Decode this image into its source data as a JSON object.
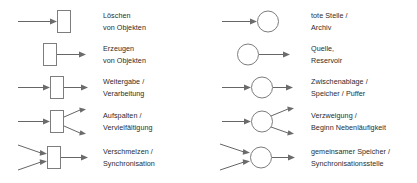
{
  "diagram": {
    "background_color": "#ffffff",
    "line_color": "#666666",
    "text_color": "#2b2b2b",
    "columns": [
      {
        "id": "transitions",
        "node_shape": "rectangle",
        "rows": [
          {
            "glyph": "arrow-in-rectangle",
            "arrows_in": 1,
            "arrows_out": 0,
            "line1": "Löschen",
            "line2": "von Objekten"
          },
          {
            "glyph": "rectangle-arrow-out",
            "arrows_in": 0,
            "arrows_out": 1,
            "line1": "Erzeugen",
            "line2": "von Objekten"
          },
          {
            "glyph": "arrow-in-rectangle-arrow-out",
            "arrows_in": 1,
            "arrows_out": 1,
            "line1": "Weitergabe /",
            "line2": "Verarbeitung"
          },
          {
            "glyph": "arrow-in-rectangle-two-arrows-out",
            "arrows_in": 1,
            "arrows_out": 2,
            "line1": "Aufspalten /",
            "line2": "Vervielfältigung"
          },
          {
            "glyph": "two-arrows-in-rectangle-arrow-out",
            "arrows_in": 2,
            "arrows_out": 1,
            "line1": "Verschmelzen /",
            "line2": "Synchronisation"
          }
        ]
      },
      {
        "id": "places",
        "node_shape": "circle",
        "rows": [
          {
            "glyph": "arrow-in-circle",
            "arrows_in": 1,
            "arrows_out": 0,
            "line1": "tote Stelle /",
            "line2": "Archiv"
          },
          {
            "glyph": "circle-arrow-out",
            "arrows_in": 0,
            "arrows_out": 1,
            "line1": "Quelle,",
            "line2": "Reservoir"
          },
          {
            "glyph": "arrow-in-circle-arrow-out",
            "arrows_in": 1,
            "arrows_out": 1,
            "line1": "Zwischenablage /",
            "line2": "Speicher / Puffer"
          },
          {
            "glyph": "arrow-in-circle-two-arrows-out",
            "arrows_in": 1,
            "arrows_out": 2,
            "line1": "Verzweigung /",
            "line2": "Beginn Nebenläufigkeit"
          },
          {
            "glyph": "two-arrows-in-circle-arrow-out",
            "arrows_in": 2,
            "arrows_out": 1,
            "line1": "gemeinsamer Speicher /",
            "line2": "Synchronisationsstelle"
          }
        ]
      }
    ]
  }
}
